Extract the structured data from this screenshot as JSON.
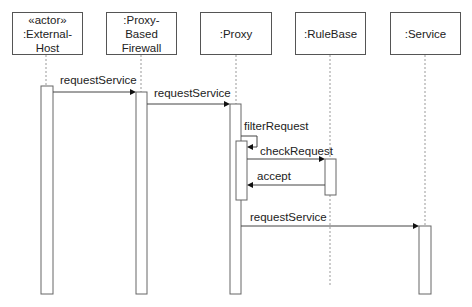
{
  "diagram": {
    "type": "UML sequence diagram",
    "lifelines": [
      {
        "id": "external_host",
        "lines": [
          "«actor»",
          ":External-",
          "Host"
        ]
      },
      {
        "id": "proxy_firewall",
        "lines": [
          ":Proxy-",
          "Based",
          "Firewall"
        ]
      },
      {
        "id": "proxy",
        "lines": [
          ":Proxy"
        ]
      },
      {
        "id": "rulebase",
        "lines": [
          ":RuleBase"
        ]
      },
      {
        "id": "service",
        "lines": [
          ":Service"
        ]
      }
    ],
    "messages": [
      {
        "label": "requestService",
        "from": "external_host",
        "to": "proxy_firewall"
      },
      {
        "label": "requestService",
        "from": "proxy_firewall",
        "to": "proxy"
      },
      {
        "label": "filterRequest",
        "from": "proxy",
        "to": "proxy",
        "self": true
      },
      {
        "label": "checkRequest",
        "from": "proxy",
        "to": "rulebase"
      },
      {
        "label": "accept",
        "from": "rulebase",
        "to": "proxy",
        "reply": true
      },
      {
        "label": "requestService",
        "from": "proxy",
        "to": "service"
      }
    ],
    "colors": {
      "line": "#555555",
      "lifeline": "#888888",
      "text": "#222222"
    }
  }
}
